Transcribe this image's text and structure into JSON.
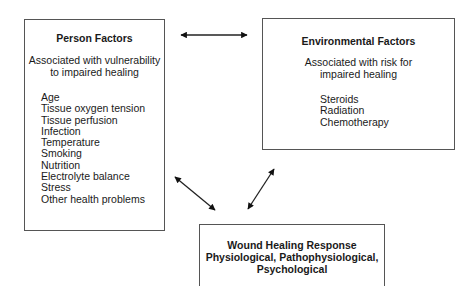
{
  "person_factors": {
    "title": "Person Factors",
    "subtitle_line1": "Associated with vulnerability",
    "subtitle_line2": "to impaired healing",
    "items": [
      "Age",
      "Tissue oxygen tension",
      "Tissue perfusion",
      "Infection",
      "Temperature",
      "Smoking",
      "Nutrition",
      "Electrolyte balance",
      "Stress",
      "Other health problems"
    ]
  },
  "environmental_factors": {
    "title": "Environmental Factors",
    "subtitle_line1": "Associated with risk for",
    "subtitle_line2": "impaired healing",
    "items": [
      "Steroids",
      "Radiation",
      "Chemotherapy"
    ]
  },
  "wound_healing": {
    "title_line1": "Wound Healing Response",
    "title_line2": "Physiological, Pathophysiological,",
    "title_line3": "Psychological"
  },
  "arrows": [
    {
      "from": "person-factors",
      "to": "environmental-factors",
      "type": "bidirectional"
    },
    {
      "from": "person-factors",
      "to": "wound-healing-response",
      "type": "bidirectional"
    },
    {
      "from": "environmental-factors",
      "to": "wound-healing-response",
      "type": "bidirectional"
    }
  ]
}
